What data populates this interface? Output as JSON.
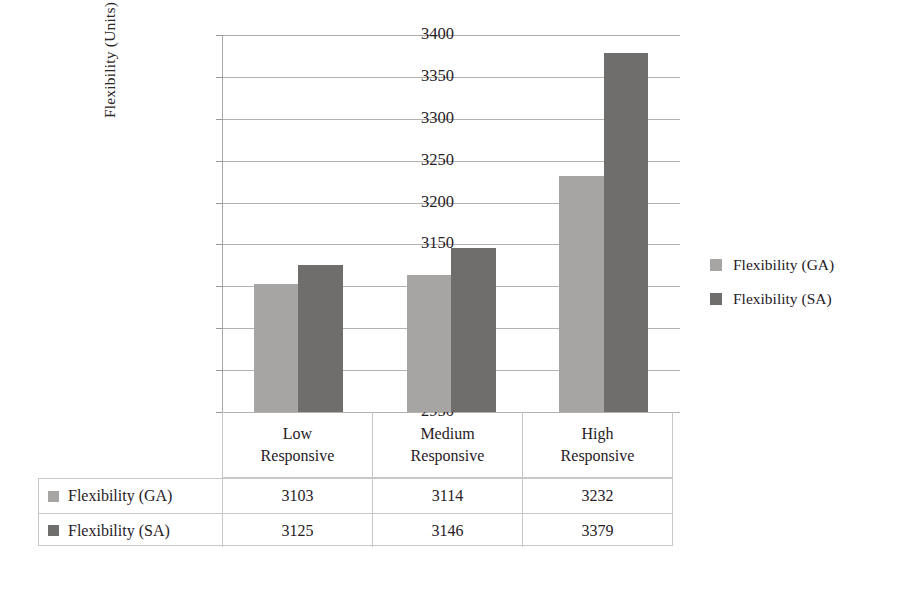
{
  "chart_data": {
    "type": "bar",
    "title": "",
    "subtitle": "",
    "xlabel": "",
    "ylabel": "Flexibility (Units)",
    "categories": [
      "Low\nResponsive",
      "Medium\nResponsive",
      "High\nResponsive"
    ],
    "category_lines": [
      [
        "Low",
        "Responsive"
      ],
      [
        "Medium",
        "Responsive"
      ],
      [
        "High",
        "Responsive"
      ]
    ],
    "series": [
      {
        "name": "Flexibility (GA)",
        "values": [
          3103,
          3114,
          3232
        ],
        "color": "#a6a5a3"
      },
      {
        "name": "Flexibility (SA)",
        "values": [
          3125,
          3146,
          3379
        ],
        "color": "#6f6e6c"
      }
    ],
    "ylim": [
      2950,
      3400
    ],
    "ytick_step": 50,
    "ytick_labels": [
      "3400",
      "3350",
      "3300",
      "3250",
      "3200",
      "3150",
      "3100",
      "3050",
      "3000",
      "2950"
    ],
    "ytick_values": [
      3400,
      3350,
      3300,
      3250,
      3200,
      3150,
      3100,
      3050,
      3000,
      2950
    ],
    "grid": true,
    "legend_position": "right",
    "has_data_table": true
  },
  "legend": {
    "items": [
      {
        "label": "Flexibility (GA)",
        "swatch": "ga"
      },
      {
        "label": "Flexibility (SA)",
        "swatch": "sa"
      }
    ]
  },
  "data_table": {
    "rows": [
      {
        "label": "Flexibility (GA)",
        "swatch": "ga",
        "cells": [
          "3103",
          "3114",
          "3232"
        ]
      },
      {
        "label": "Flexibility (SA)",
        "swatch": "sa",
        "cells": [
          "3125",
          "3146",
          "3379"
        ]
      }
    ]
  }
}
